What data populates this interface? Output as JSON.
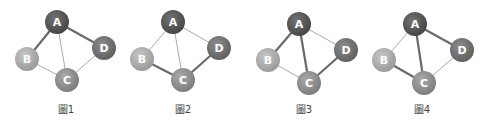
{
  "figures": [
    {
      "caption": "圖1",
      "caption_pos": [
        66,
        113
      ],
      "nodes": {
        "A": [
          57,
          22
        ],
        "B": [
          27,
          59
        ],
        "C": [
          67,
          80
        ],
        "D": [
          104,
          48
        ]
      },
      "edges": [
        {
          "from": "A",
          "to": "B",
          "thick": true
        },
        {
          "from": "A",
          "to": "D",
          "thick": true
        },
        {
          "from": "A",
          "to": "C",
          "thick": false
        },
        {
          "from": "B",
          "to": "C",
          "thick": false
        },
        {
          "from": "C",
          "to": "D",
          "thick": false
        }
      ]
    },
    {
      "caption": "圖2",
      "caption_pos": [
        183,
        113
      ],
      "nodes": {
        "A": [
          173,
          22
        ],
        "B": [
          142,
          59
        ],
        "C": [
          183,
          80
        ],
        "D": [
          219,
          48
        ]
      },
      "edges": [
        {
          "from": "A",
          "to": "B",
          "thick": false
        },
        {
          "from": "A",
          "to": "D",
          "thick": false
        },
        {
          "from": "A",
          "to": "C",
          "thick": false
        },
        {
          "from": "B",
          "to": "C",
          "thick": true
        },
        {
          "from": "C",
          "to": "D",
          "thick": true
        }
      ]
    },
    {
      "caption": "圖3",
      "caption_pos": [
        304,
        113
      ],
      "nodes": {
        "A": [
          299,
          24
        ],
        "B": [
          268,
          60
        ],
        "C": [
          309,
          83
        ],
        "D": [
          346,
          50
        ]
      },
      "edges": [
        {
          "from": "A",
          "to": "B",
          "thick": true
        },
        {
          "from": "A",
          "to": "D",
          "thick": false
        },
        {
          "from": "A",
          "to": "C",
          "thick": true
        },
        {
          "from": "B",
          "to": "C",
          "thick": false
        },
        {
          "from": "C",
          "to": "D",
          "thick": true
        }
      ]
    },
    {
      "caption": "圖4",
      "caption_pos": [
        422,
        113
      ],
      "nodes": {
        "A": [
          415,
          24
        ],
        "B": [
          384,
          60
        ],
        "C": [
          424,
          83
        ],
        "D": [
          462,
          50
        ]
      },
      "edges": [
        {
          "from": "A",
          "to": "B",
          "thick": false
        },
        {
          "from": "A",
          "to": "D",
          "thick": true
        },
        {
          "from": "A",
          "to": "C",
          "thick": true
        },
        {
          "from": "B",
          "to": "C",
          "thick": true
        },
        {
          "from": "C",
          "to": "D",
          "thick": false
        }
      ]
    }
  ],
  "node_colors": {
    "A": "#555555",
    "B": "#a9a9a9",
    "C": "#8c8c8c",
    "D": "#6f6f6f"
  },
  "edge_colors": {
    "thick": "#6a6a6a",
    "thin": "#a0a0a0"
  },
  "node_radius": 12
}
